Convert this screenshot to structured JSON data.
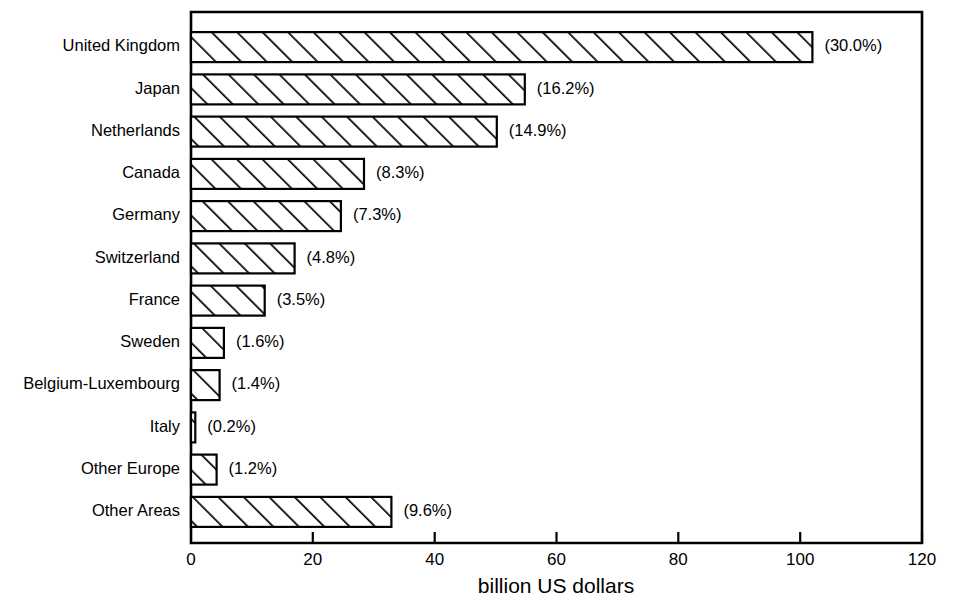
{
  "chart_data": {
    "type": "bar",
    "orientation": "horizontal",
    "title": "",
    "subtitle": "",
    "xlabel": "billion US dollars",
    "ylabel": "",
    "xlim": [
      0,
      120
    ],
    "ylim": null,
    "grid": false,
    "legend": null,
    "xticks": [
      0,
      20,
      40,
      60,
      80,
      100,
      120
    ],
    "xtick_labels": [
      "0",
      "20",
      "40",
      "60",
      "80",
      "100",
      "120"
    ],
    "categories": [
      "United Kingdom",
      "Japan",
      "Netherlands",
      "Canada",
      "Germany",
      "Switzerland",
      "France",
      "Sweden",
      "Belgium-Luxembourg",
      "Italy",
      "Other Europe",
      "Other Areas"
    ],
    "values": [
      102.0,
      54.8,
      50.2,
      28.4,
      24.6,
      17.0,
      12.1,
      5.4,
      4.7,
      0.7,
      4.2,
      32.9
    ],
    "annotations": [
      "(30.0%)",
      "(16.2%)",
      "(14.9%)",
      "(8.3%)",
      "(7.3%)",
      "(4.8%)",
      "(3.5%)",
      "(1.6%)",
      "(1.4%)",
      "(0.2%)",
      "(1.2%)",
      "(9.6%)"
    ],
    "series": [
      {
        "name": "billion US dollars",
        "values": [
          102.0,
          54.8,
          50.2,
          28.4,
          24.6,
          17.0,
          12.1,
          5.4,
          4.7,
          0.7,
          4.2,
          32.9
        ]
      }
    ],
    "style": {
      "bar_fill": "hatched-diagonal",
      "bar_edge_color": "#000000",
      "background": "#ffffff"
    }
  }
}
